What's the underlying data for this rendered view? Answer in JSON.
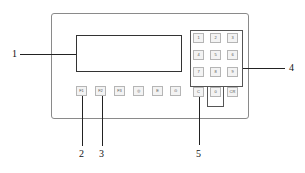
{
  "diagram": {
    "display": {
      "label": "1"
    },
    "function_keys": [
      "F1",
      "F2",
      "F3",
      "◎",
      "E",
      "⊙"
    ],
    "keypad": [
      "1",
      "2",
      "3",
      "4",
      "5",
      "6",
      "7",
      "8",
      "9"
    ],
    "bottom_keys": [
      "C",
      "0",
      "CR"
    ],
    "callouts": [
      "1",
      "2",
      "3",
      "4",
      "5"
    ]
  }
}
